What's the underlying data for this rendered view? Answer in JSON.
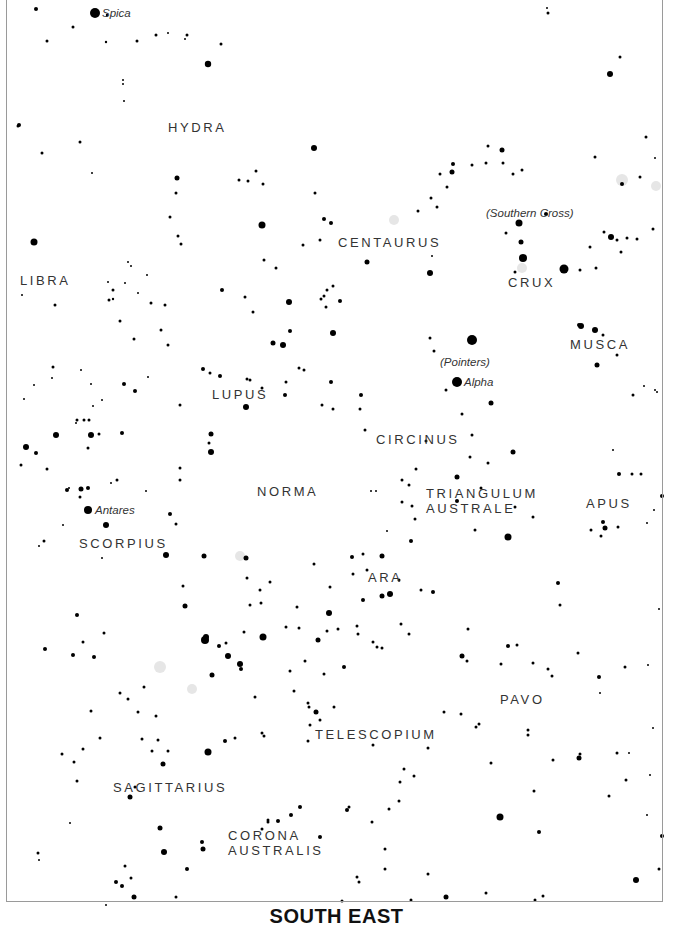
{
  "title": "SOUTH EAST",
  "colors": {
    "star": "#000000",
    "label": "#333333",
    "frame": "#9a9a9a",
    "nebula": "#e6e6e6"
  },
  "constellations": [
    {
      "name": "HYDRA",
      "x": 168,
      "y": 120
    },
    {
      "name": "LIBRA",
      "x": 20,
      "y": 273
    },
    {
      "name": "CENTAURUS",
      "x": 338,
      "y": 235
    },
    {
      "name": "CRUX",
      "x": 508,
      "y": 275
    },
    {
      "name": "MUSCA",
      "x": 570,
      "y": 337
    },
    {
      "name": "LUPUS",
      "x": 212,
      "y": 387
    },
    {
      "name": "CIRCINUS",
      "x": 376,
      "y": 432
    },
    {
      "name": "NORMA",
      "x": 257,
      "y": 484
    },
    {
      "name": "TRIANGULUM\nAUSTRALE",
      "x": 426,
      "y": 486
    },
    {
      "name": "APUS",
      "x": 586,
      "y": 496
    },
    {
      "name": "SCORPIUS",
      "x": 79,
      "y": 536
    },
    {
      "name": "ARA",
      "x": 368,
      "y": 570
    },
    {
      "name": "PAVO",
      "x": 500,
      "y": 692
    },
    {
      "name": "TELESCOPIUM",
      "x": 315,
      "y": 727
    },
    {
      "name": "SAGITTARIUS",
      "x": 113,
      "y": 780
    },
    {
      "name": "CORONA\nAUSTRALIS",
      "x": 228,
      "y": 828
    }
  ],
  "named_stars": [
    {
      "name": "Spica",
      "x": 102,
      "y": 7
    },
    {
      "name": "(Southern Cross)",
      "x": 486,
      "y": 207
    },
    {
      "name": "(Pointers)",
      "x": 440,
      "y": 356
    },
    {
      "name": "Alpha",
      "x": 464,
      "y": 376
    },
    {
      "name": "Antares",
      "x": 95,
      "y": 504
    }
  ],
  "nebulae": [
    [
      394,
      220,
      5
    ],
    [
      622,
      180,
      6
    ],
    [
      656,
      186,
      5
    ],
    [
      522,
      268,
      5
    ],
    [
      160,
      667,
      6
    ],
    [
      192,
      689,
      5
    ],
    [
      240,
      556,
      5
    ]
  ],
  "stars": [
    [
      95,
      13,
      5
    ],
    [
      36,
      9,
      2
    ],
    [
      107,
      15,
      1.2
    ],
    [
      73,
      27,
      1.5
    ],
    [
      47,
      41,
      1.5
    ],
    [
      106,
      42,
      1.2
    ],
    [
      137,
      41,
      1.5
    ],
    [
      156,
      35,
      1.5
    ],
    [
      187,
      35,
      1.5
    ],
    [
      168,
      33,
      1
    ],
    [
      185,
      39,
      1
    ],
    [
      208,
      64,
      3.2
    ],
    [
      124,
      101,
      1
    ],
    [
      123,
      80,
      1
    ],
    [
      123,
      84,
      1
    ],
    [
      221,
      44,
      1.5
    ],
    [
      18,
      126,
      1.5
    ],
    [
      42,
      153,
      1.5
    ],
    [
      80,
      142,
      1.5
    ],
    [
      92,
      173,
      1
    ],
    [
      19,
      125,
      2
    ],
    [
      34,
      242,
      3.5
    ],
    [
      109,
      300,
      1.5
    ],
    [
      113,
      290,
      1.5
    ],
    [
      113,
      299,
      1.2
    ],
    [
      128,
      262,
      1
    ],
    [
      131,
      266,
      1
    ],
    [
      147,
      275,
      1
    ],
    [
      177,
      178,
      2.5
    ],
    [
      176,
      193,
      1.5
    ],
    [
      170,
      217,
      1.5
    ],
    [
      178,
      236,
      1.5
    ],
    [
      181,
      244,
      1.5
    ],
    [
      239,
      180,
      1.5
    ],
    [
      248,
      181,
      1.5
    ],
    [
      256,
      171,
      1.5
    ],
    [
      263,
      184,
      1.5
    ],
    [
      262,
      225,
      3.5
    ],
    [
      264,
      260,
      1.5
    ],
    [
      276,
      268,
      1.5
    ],
    [
      314,
      148,
      3
    ],
    [
      331,
      223,
      2
    ],
    [
      324,
      219,
      2
    ],
    [
      320,
      240,
      1.5
    ],
    [
      303,
      245,
      1.5
    ],
    [
      289,
      302,
      3
    ],
    [
      315,
      193,
      1.5
    ],
    [
      367,
      262,
      2.5
    ],
    [
      430,
      273,
      3
    ],
    [
      432,
      256,
      1
    ],
    [
      452,
      172,
      2.5
    ],
    [
      453,
      164,
      2
    ],
    [
      472,
      165,
      1.5
    ],
    [
      486,
      163,
      1.5
    ],
    [
      503,
      163,
      1.5
    ],
    [
      502,
      150,
      2.5
    ],
    [
      522,
      170,
      1.5
    ],
    [
      546,
      214,
      2
    ],
    [
      519,
      223,
      3.5
    ],
    [
      506,
      233,
      1.5
    ],
    [
      521,
      242,
      2.5
    ],
    [
      523,
      258,
      4
    ],
    [
      515,
      272,
      1.5
    ],
    [
      564,
      269,
      4.5
    ],
    [
      580,
      270,
      1.5
    ],
    [
      596,
      268,
      1.5
    ],
    [
      590,
      247,
      1.5
    ],
    [
      617,
      240,
      1.5
    ],
    [
      611,
      237,
      3
    ],
    [
      604,
      232,
      1.5
    ],
    [
      621,
      252,
      1.5
    ],
    [
      627,
      238,
      1.5
    ],
    [
      637,
      239,
      1.5
    ],
    [
      653,
      229,
      1.5
    ],
    [
      622,
      184,
      2
    ],
    [
      640,
      177,
      1.5
    ],
    [
      646,
      137,
      1.5
    ],
    [
      655,
      158,
      1
    ],
    [
      610,
      74,
      3
    ],
    [
      620,
      57,
      1.5
    ],
    [
      548,
      13,
      1.5
    ],
    [
      547,
      8,
      1
    ],
    [
      595,
      157,
      1.5
    ],
    [
      488,
      146,
      1.5
    ],
    [
      513,
      174,
      1.5
    ],
    [
      418,
      211,
      1.5
    ],
    [
      431,
      198,
      1.5
    ],
    [
      437,
      207,
      1.5
    ],
    [
      440,
      174,
      1.5
    ],
    [
      447,
      187,
      1.5
    ],
    [
      472,
      340,
      5
    ],
    [
      457,
      382,
      5
    ],
    [
      491,
      403,
      2.5
    ],
    [
      434,
      351,
      1.5
    ],
    [
      430,
      338,
      1.5
    ],
    [
      446,
      390,
      1.5
    ],
    [
      462,
      414,
      1.5
    ],
    [
      361,
      395,
      2
    ],
    [
      360,
      409,
      1.5
    ],
    [
      365,
      430,
      1.5
    ],
    [
      426,
      441,
      1.5
    ],
    [
      472,
      435,
      1.5
    ],
    [
      470,
      457,
      1.5
    ],
    [
      513,
      452,
      2.5
    ],
    [
      488,
      463,
      1.5
    ],
    [
      457,
      477,
      2.5
    ],
    [
      457,
      501,
      2
    ],
    [
      508,
      537,
      3.5
    ],
    [
      515,
      507,
      1.5
    ],
    [
      533,
      517,
      1.5
    ],
    [
      579,
      325,
      2
    ],
    [
      581,
      326,
      3
    ],
    [
      595,
      330,
      3
    ],
    [
      597,
      365,
      2.5
    ],
    [
      617,
      355,
      1.5
    ],
    [
      633,
      395,
      1.5
    ],
    [
      657,
      392,
      1
    ],
    [
      662,
      496,
      2
    ],
    [
      619,
      474,
      2
    ],
    [
      632,
      474,
      1.5
    ],
    [
      641,
      474,
      1.5
    ],
    [
      603,
      522,
      2
    ],
    [
      605,
      528,
      2.5
    ],
    [
      591,
      530,
      1.5
    ],
    [
      603,
      335,
      1.5
    ],
    [
      333,
      333,
      3
    ],
    [
      290,
      331,
      2
    ],
    [
      273,
      343,
      2.5
    ],
    [
      283,
      345,
      3
    ],
    [
      321,
      299,
      1.5
    ],
    [
      324,
      296,
      1.5
    ],
    [
      327,
      290,
      1.5
    ],
    [
      340,
      301,
      2
    ],
    [
      326,
      307,
      1.5
    ],
    [
      333,
      286,
      1.5
    ],
    [
      299,
      368,
      1.5
    ],
    [
      304,
      370,
      1.5
    ],
    [
      331,
      382,
      2
    ],
    [
      333,
      409,
      1.5
    ],
    [
      322,
      405,
      1.5
    ],
    [
      285,
      395,
      2
    ],
    [
      286,
      382,
      1.5
    ],
    [
      246,
      407,
      3
    ],
    [
      250,
      380,
      1.5
    ],
    [
      247,
      379,
      1.5
    ],
    [
      262,
      388,
      1.5
    ],
    [
      220,
      376,
      2
    ],
    [
      203,
      369,
      2
    ],
    [
      210,
      373,
      1.5
    ],
    [
      222,
      290,
      2
    ],
    [
      245,
      297,
      1.5
    ],
    [
      253,
      312,
      1.5
    ],
    [
      211,
      452,
      3
    ],
    [
      211,
      434,
      2.5
    ],
    [
      209,
      443,
      1.5
    ],
    [
      180,
      468,
      1.5
    ],
    [
      180,
      480,
      1.5
    ],
    [
      124,
      384,
      2
    ],
    [
      135,
      391,
      2
    ],
    [
      148,
      377,
      1
    ],
    [
      151,
      303,
      1.5
    ],
    [
      165,
      305,
      1.5
    ],
    [
      161,
      330,
      1.5
    ],
    [
      180,
      405,
      1.5
    ],
    [
      56,
      435,
      3
    ],
    [
      91,
      435,
      3
    ],
    [
      122,
      433,
      2
    ],
    [
      26,
      447,
      3
    ],
    [
      36,
      453,
      2
    ],
    [
      21,
      465,
      1.5
    ],
    [
      81,
      489,
      2.5
    ],
    [
      67,
      490,
      2
    ],
    [
      88,
      488,
      2
    ],
    [
      80,
      497,
      1.5
    ],
    [
      69,
      488,
      1
    ],
    [
      84,
      420,
      1.5
    ],
    [
      77,
      420,
      1.5
    ],
    [
      89,
      420,
      1.5
    ],
    [
      99,
      434,
      1.5
    ],
    [
      88,
      448,
      1.5
    ],
    [
      76,
      423,
      1
    ],
    [
      24,
      399,
      1
    ],
    [
      34,
      385,
      1
    ],
    [
      117,
      480,
      1.5
    ],
    [
      111,
      483,
      1
    ],
    [
      47,
      469,
      1.5
    ],
    [
      88,
      510,
      4
    ],
    [
      106,
      525,
      3
    ],
    [
      170,
      514,
      2
    ],
    [
      176,
      524,
      1.5
    ],
    [
      146,
      491,
      1
    ],
    [
      166,
      555,
      3
    ],
    [
      204,
      556,
      2.5
    ],
    [
      246,
      558,
      2.5
    ],
    [
      44,
      541,
      1.5
    ],
    [
      63,
      525,
      1
    ],
    [
      102,
      558,
      1
    ],
    [
      39,
      546,
      1
    ],
    [
      102,
      400,
      1
    ],
    [
      93,
      406,
      1
    ],
    [
      55,
      305,
      1.5
    ],
    [
      53,
      367,
      1.5
    ],
    [
      52,
      378,
      1
    ],
    [
      22,
      295,
      1
    ],
    [
      108,
      282,
      1
    ],
    [
      125,
      283,
      1
    ],
    [
      138,
      293,
      1
    ],
    [
      120,
      321,
      1.5
    ],
    [
      81,
      370,
      1
    ],
    [
      91,
      384,
      1
    ],
    [
      134,
      339,
      1.5
    ],
    [
      168,
      345,
      1.5
    ],
    [
      352,
      557,
      2
    ],
    [
      382,
      556,
      2.5
    ],
    [
      390,
      594,
      3
    ],
    [
      382,
      596,
      2.5
    ],
    [
      433,
      592,
      2
    ],
    [
      411,
      541,
      2
    ],
    [
      415,
      519,
      1.5
    ],
    [
      402,
      480,
      1.5
    ],
    [
      402,
      502,
      1.5
    ],
    [
      371,
      491,
      1
    ],
    [
      376,
      491,
      1
    ],
    [
      387,
      531,
      1
    ],
    [
      367,
      570,
      1.5
    ],
    [
      314,
      564,
      1.5
    ],
    [
      329,
      613,
      3
    ],
    [
      330,
      587,
      1.5
    ],
    [
      297,
      607,
      1.5
    ],
    [
      299,
      628,
      1.5
    ],
    [
      344,
      667,
      2
    ],
    [
      316,
      712,
      2.5
    ],
    [
      310,
      725,
      1.5
    ],
    [
      263,
      637,
      3.5
    ],
    [
      226,
      643,
      1.5
    ],
    [
      205,
      640,
      4
    ],
    [
      206,
      637,
      3
    ],
    [
      219,
      646,
      2
    ],
    [
      228,
      656,
      3
    ],
    [
      240,
      664,
      3
    ],
    [
      241,
      669,
      2
    ],
    [
      212,
      675,
      2.5
    ],
    [
      247,
      578,
      1.5
    ],
    [
      270,
      582,
      1.5
    ],
    [
      244,
      632,
      1.5
    ],
    [
      260,
      590,
      1.5
    ],
    [
      261,
      603,
      1.5
    ],
    [
      250,
      605,
      1.5
    ],
    [
      290,
      671,
      1.5
    ],
    [
      308,
      703,
      1.5
    ],
    [
      334,
      707,
      1.5
    ],
    [
      324,
      674,
      1.5
    ],
    [
      338,
      629,
      1.5
    ],
    [
      357,
      626,
      1.5
    ],
    [
      358,
      634,
      1.5
    ],
    [
      363,
      600,
      2
    ],
    [
      373,
      642,
      1.5
    ],
    [
      377,
      647,
      1.5
    ],
    [
      401,
      624,
      1.5
    ],
    [
      409,
      634,
      1.5
    ],
    [
      428,
      748,
      1.5
    ],
    [
      414,
      776,
      1.5
    ],
    [
      444,
      712,
      1.5
    ],
    [
      461,
      714,
      1.5
    ],
    [
      462,
      656,
      2.5
    ],
    [
      467,
      661,
      1.5
    ],
    [
      528,
      735,
      1.5
    ],
    [
      553,
      760,
      1.5
    ],
    [
      579,
      758,
      2.5
    ],
    [
      580,
      754,
      1.5
    ],
    [
      609,
      796,
      1.5
    ],
    [
      528,
      730,
      1.5
    ],
    [
      491,
      763,
      1.5
    ],
    [
      508,
      646,
      2
    ],
    [
      501,
      664,
      1.5
    ],
    [
      533,
      663,
      1.5
    ],
    [
      548,
      669,
      1.5
    ],
    [
      552,
      676,
      1.5
    ],
    [
      578,
      653,
      1.5
    ],
    [
      599,
      677,
      2
    ],
    [
      600,
      693,
      1
    ],
    [
      625,
      667,
      1.5
    ],
    [
      617,
      753,
      1.5
    ],
    [
      626,
      780,
      1.5
    ],
    [
      662,
      836,
      2
    ],
    [
      659,
      869,
      1.5
    ],
    [
      636,
      880,
      3
    ],
    [
      558,
      583,
      2
    ],
    [
      560,
      605,
      1.5
    ],
    [
      517,
      645,
      1.5
    ],
    [
      500,
      817,
      3.5
    ],
    [
      539,
      832,
      2
    ],
    [
      534,
      791,
      1.5
    ],
    [
      486,
      893,
      1.5
    ],
    [
      543,
      896,
      1.5
    ],
    [
      535,
      900,
      1.5
    ],
    [
      446,
      897,
      2.5
    ],
    [
      359,
      882,
      1.5
    ],
    [
      385,
      849,
      1.5
    ],
    [
      428,
      874,
      1.5
    ],
    [
      342,
      901,
      1.5
    ],
    [
      357,
      877,
      1.5
    ],
    [
      385,
      869,
      1.5
    ],
    [
      411,
      900,
      1.5
    ],
    [
      372,
      822,
      1.5
    ],
    [
      399,
      801,
      1.5
    ],
    [
      347,
      810,
      2
    ],
    [
      349,
      807,
      1.5
    ],
    [
      389,
      809,
      1.5
    ],
    [
      400,
      782,
      1.5
    ],
    [
      404,
      769,
      1.5
    ],
    [
      373,
      745,
      1.5
    ],
    [
      382,
      648,
      1.5
    ],
    [
      309,
      707,
      1.5
    ],
    [
      208,
      752,
      3.5
    ],
    [
      203,
      849,
      2.5
    ],
    [
      225,
      741,
      2
    ],
    [
      255,
      697,
      1.5
    ],
    [
      308,
      741,
      1.5
    ],
    [
      320,
      720,
      1.5
    ],
    [
      163,
      764,
      2.5
    ],
    [
      158,
      740,
      1.5
    ],
    [
      152,
      751,
      1.5
    ],
    [
      142,
      739,
      1.5
    ],
    [
      130,
      797,
      2.5
    ],
    [
      135,
      787,
      1.5
    ],
    [
      83,
      642,
      1.5
    ],
    [
      91,
      711,
      1.5
    ],
    [
      100,
      738,
      1.5
    ],
    [
      83,
      749,
      1.5
    ],
    [
      62,
      754,
      1.5
    ],
    [
      74,
      762,
      1.5
    ],
    [
      77,
      781,
      1.5
    ],
    [
      70,
      823,
      1
    ],
    [
      38,
      853,
      1.5
    ],
    [
      39,
      860,
      1
    ],
    [
      45,
      649,
      2
    ],
    [
      77,
      615,
      2
    ],
    [
      73,
      655,
      2
    ],
    [
      144,
      687,
      1.5
    ],
    [
      183,
      586,
      1.5
    ],
    [
      185,
      606,
      2.5
    ],
    [
      168,
      751,
      1.5
    ],
    [
      160,
      828,
      2.5
    ],
    [
      164,
      852,
      3
    ],
    [
      202,
      842,
      2
    ],
    [
      187,
      869,
      2
    ],
    [
      131,
      878,
      1.5
    ],
    [
      116,
      882,
      2
    ],
    [
      122,
      886,
      2
    ],
    [
      125,
      866,
      1.5
    ],
    [
      106,
      905,
      1
    ],
    [
      134,
      897,
      2.5
    ],
    [
      176,
      897,
      1.5
    ],
    [
      104,
      633,
      1.5
    ],
    [
      94,
      657,
      2
    ],
    [
      120,
      693,
      1.5
    ],
    [
      128,
      699,
      1.5
    ],
    [
      138,
      712,
      1.5
    ],
    [
      156,
      716,
      1.5
    ],
    [
      235,
      738,
      1.5
    ],
    [
      262,
      733,
      1.5
    ],
    [
      264,
      736,
      1.5
    ],
    [
      268,
      820,
      1.5
    ],
    [
      268,
      822,
      1.5
    ],
    [
      278,
      821,
      2
    ],
    [
      291,
      815,
      2
    ],
    [
      300,
      807,
      2
    ],
    [
      320,
      837,
      2
    ],
    [
      262,
      829,
      1.5
    ],
    [
      294,
      691,
      1.5
    ],
    [
      305,
      661,
      1.5
    ],
    [
      286,
      627,
      1.5
    ],
    [
      318,
      640,
      2.5
    ],
    [
      327,
      631,
      1.5
    ],
    [
      353,
      574,
      1.5
    ],
    [
      363,
      554,
      1.5
    ],
    [
      409,
      485,
      1.5
    ],
    [
      416,
      469,
      1.5
    ],
    [
      481,
      488,
      1.5
    ],
    [
      475,
      530,
      1.5
    ],
    [
      412,
      506,
      1.5
    ],
    [
      399,
      580,
      1.5
    ],
    [
      421,
      590,
      1.5
    ],
    [
      468,
      629,
      1.5
    ],
    [
      479,
      724,
      1.5
    ],
    [
      476,
      727,
      1.5
    ],
    [
      618,
      527,
      1.5
    ],
    [
      647,
      523,
      1
    ],
    [
      654,
      510,
      1
    ],
    [
      659,
      609,
      1
    ],
    [
      648,
      665,
      1
    ],
    [
      653,
      728,
      1
    ],
    [
      650,
      775,
      1
    ],
    [
      647,
      815,
      1
    ],
    [
      629,
      753,
      1
    ],
    [
      655,
      390,
      1
    ],
    [
      644,
      386,
      1
    ],
    [
      613,
      450,
      1
    ],
    [
      601,
      536,
      1.5
    ]
  ]
}
